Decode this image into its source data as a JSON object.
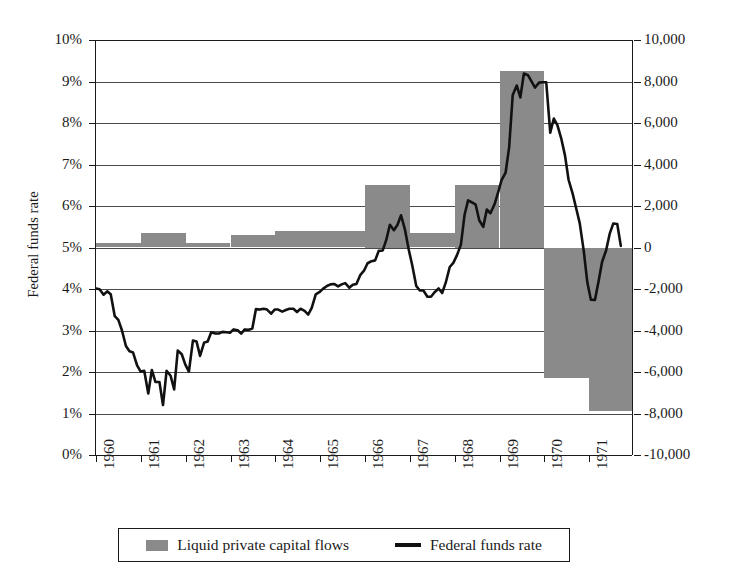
{
  "chart_data": {
    "type": "line",
    "title": "",
    "xlabel": "",
    "ylabel": "Federal funds rate",
    "ylabel_right": "Liquid private capital flows, millions of dollars",
    "grid": true,
    "legend_position": "bottom",
    "colors": {
      "bars": "#8a8a8a",
      "line": "#111111",
      "axis": "#1a1a1a",
      "grid": "#4a4a4a",
      "background": "#ffffff"
    },
    "x_axis": {
      "tick_labels": [
        "1960",
        "1961",
        "1962",
        "1963",
        "1964",
        "1965",
        "1966",
        "1967",
        "1968",
        "1969",
        "1970",
        "1971"
      ],
      "range": [
        1960,
        1972
      ]
    },
    "y_axis_left": {
      "label": "Federal funds rate",
      "tick_labels": [
        "0%",
        "1%",
        "2%",
        "3%",
        "4%",
        "5%",
        "6%",
        "7%",
        "8%",
        "9%",
        "10%"
      ],
      "values": [
        0,
        1,
        2,
        3,
        4,
        5,
        6,
        7,
        8,
        9,
        10
      ],
      "range": [
        0,
        10
      ],
      "unit": "percent"
    },
    "y_axis_right": {
      "label": "Liquid private capital flows, millions of dollars",
      "tick_labels": [
        "-10,000",
        "-8,000",
        "-6,000",
        "-4,000",
        "-2,000",
        "0",
        "2,000",
        "4,000",
        "6,000",
        "8,000",
        "10,000"
      ],
      "values": [
        -10000,
        -8000,
        -6000,
        -4000,
        -2000,
        0,
        2000,
        4000,
        6000,
        8000,
        10000
      ],
      "range": [
        -10000,
        10000
      ],
      "unit": "millions of dollars"
    },
    "series": [
      {
        "name": "Liquid private capital flows",
        "type": "bar",
        "axis": "right",
        "categories": [
          "1960",
          "1961",
          "1962",
          "1963",
          "1964",
          "1965",
          "1966",
          "1967",
          "1968",
          "1969",
          "1970",
          "1971"
        ],
        "values": [
          200,
          700,
          200,
          600,
          800,
          800,
          3000,
          700,
          3000,
          8500,
          -6300,
          -7900
        ]
      },
      {
        "name": "Federal funds rate",
        "type": "line",
        "axis": "left",
        "x": [
          1960.0,
          1960.08,
          1960.17,
          1960.25,
          1960.33,
          1960.42,
          1960.5,
          1960.58,
          1960.67,
          1960.75,
          1960.83,
          1960.92,
          1961.0,
          1961.08,
          1961.17,
          1961.25,
          1961.33,
          1961.42,
          1961.5,
          1961.58,
          1961.67,
          1961.75,
          1961.83,
          1961.92,
          1962.0,
          1962.08,
          1962.17,
          1962.25,
          1962.33,
          1962.42,
          1962.5,
          1962.58,
          1962.67,
          1962.75,
          1962.83,
          1962.92,
          1963.0,
          1963.08,
          1963.17,
          1963.25,
          1963.33,
          1963.42,
          1963.5,
          1963.58,
          1963.67,
          1963.75,
          1963.83,
          1963.92,
          1964.0,
          1964.08,
          1964.17,
          1964.25,
          1964.33,
          1964.42,
          1964.5,
          1964.58,
          1964.67,
          1964.75,
          1964.83,
          1964.92,
          1965.0,
          1965.08,
          1965.17,
          1965.25,
          1965.33,
          1965.42,
          1965.5,
          1965.58,
          1965.67,
          1965.75,
          1965.83,
          1965.92,
          1966.0,
          1966.08,
          1966.17,
          1966.25,
          1966.33,
          1966.42,
          1966.5,
          1966.58,
          1966.67,
          1966.75,
          1966.83,
          1966.92,
          1967.0,
          1967.08,
          1967.17,
          1967.25,
          1967.33,
          1967.42,
          1967.5,
          1967.58,
          1967.67,
          1967.75,
          1967.83,
          1967.92,
          1968.0,
          1968.08,
          1968.17,
          1968.25,
          1968.33,
          1968.42,
          1968.5,
          1968.58,
          1968.67,
          1968.75,
          1968.83,
          1968.92,
          1969.0,
          1969.08,
          1969.17,
          1969.25,
          1969.33,
          1969.42,
          1969.5,
          1969.58,
          1969.67,
          1969.75,
          1969.83,
          1969.92,
          1970.0,
          1970.08,
          1970.17,
          1970.25,
          1970.33,
          1970.42,
          1970.5,
          1970.58,
          1970.67,
          1970.75,
          1970.83,
          1970.92,
          1971.0,
          1971.08,
          1971.17,
          1971.25,
          1971.33,
          1971.42,
          1971.5,
          1971.58,
          1971.67,
          1971.75
        ],
        "values": [
          3.99,
          3.97,
          3.84,
          3.92,
          3.85,
          3.32,
          3.23,
          2.98,
          2.6,
          2.47,
          2.44,
          2.13,
          1.98,
          2.0,
          1.45,
          2.02,
          1.73,
          1.73,
          1.17,
          2.0,
          1.88,
          1.55,
          2.49,
          2.4,
          2.15,
          1.98,
          2.73,
          2.71,
          2.36,
          2.68,
          2.71,
          2.93,
          2.9,
          2.9,
          2.94,
          2.93,
          2.92,
          3.0,
          2.98,
          2.9,
          3.0,
          2.99,
          3.02,
          3.49,
          3.48,
          3.5,
          3.48,
          3.38,
          3.48,
          3.48,
          3.43,
          3.47,
          3.5,
          3.5,
          3.42,
          3.5,
          3.45,
          3.36,
          3.52,
          3.85,
          3.9,
          3.98,
          4.05,
          4.09,
          4.1,
          4.04,
          4.09,
          4.12,
          4.01,
          4.08,
          4.1,
          4.32,
          4.42,
          4.6,
          4.65,
          4.67,
          4.9,
          4.91,
          5.17,
          5.53,
          5.4,
          5.53,
          5.76,
          5.4,
          4.94,
          4.55,
          4.05,
          3.94,
          3.94,
          3.79,
          3.79,
          3.9,
          3.99,
          3.88,
          4.13,
          4.51,
          4.61,
          4.79,
          5.05,
          5.76,
          6.12,
          6.07,
          6.02,
          5.64,
          5.48,
          5.9,
          5.81,
          6.02,
          6.3,
          6.61,
          6.79,
          7.41,
          8.67,
          8.9,
          8.61,
          9.19,
          9.15,
          9.0,
          8.85,
          8.97,
          8.98,
          8.98,
          7.76,
          8.1,
          7.94,
          7.6,
          7.21,
          6.62,
          6.29,
          5.93,
          5.57,
          4.9,
          4.14,
          3.72,
          3.71,
          4.15,
          4.63,
          4.91,
          5.31,
          5.56,
          5.55,
          5.02
        ]
      }
    ]
  },
  "legend": {
    "entries": [
      {
        "label": "Liquid private capital flows",
        "marker": "bar-swatch",
        "color": "#8a8a8a"
      },
      {
        "label": "Federal funds rate",
        "marker": "line-swatch",
        "color": "#111111"
      }
    ]
  }
}
